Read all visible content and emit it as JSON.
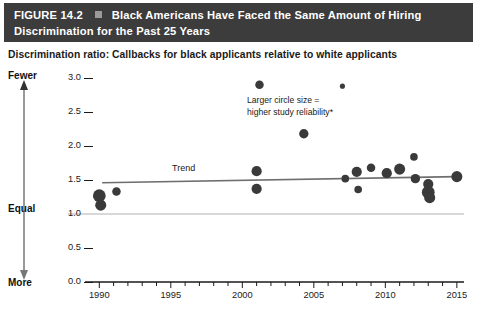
{
  "figure": {
    "label": "FIGURE 14.2",
    "separator_icon": "square-bullet",
    "title": "Black Americans Have Faced the Same Amount of Hiring Discrimination for the Past 25 Years",
    "title_line_1": "Black Americans Have Faced the Same Amount of Hiring",
    "title_line_2": "Discrimination for the Past 25 Years",
    "subtitle": "Discrimination ratio: Callbacks for black applicants relative to white applicants"
  },
  "colors": {
    "title_bar_bg": "#3c3c3c",
    "title_text": "#ffffff",
    "marker": "#3a3a3a",
    "trend_line": "#6e6e6e",
    "equal_line": "#b0b0b0",
    "axis": "#1a1a1a",
    "page_bg": "#ffffff"
  },
  "annotations": {
    "size_legend": "Larger circle size =\nhigher study reliability*",
    "size_legend_line_1": "Larger circle size =",
    "size_legend_line_2": "higher study reliability*",
    "trend_label": "Trend",
    "axis_top_label": "Fewer",
    "axis_mid_label": "Equal",
    "axis_bottom_label": "More"
  },
  "chart_data": {
    "type": "scatter",
    "title": "Black Americans Have Faced the Same Amount of Hiring Discrimination for the Past 25 Years",
    "subtitle": "Discrimination ratio: Callbacks for black applicants relative to white applicants",
    "xlabel": "",
    "ylabel": "",
    "xlim": [
      1989,
      2015.5
    ],
    "ylim": [
      0.0,
      3.1
    ],
    "xticks": [
      1990,
      1995,
      2000,
      2005,
      2010,
      2015
    ],
    "xtick_labels": [
      "1990",
      "1995",
      "2000",
      "2005",
      "2010",
      "2015"
    ],
    "minor_xtick_interval": 1,
    "yticks": [
      0.0,
      0.5,
      1.0,
      1.5,
      2.0,
      2.5,
      3.0
    ],
    "ytick_labels": [
      "0.0",
      "0.5",
      "1.0",
      "1.5",
      "2.0",
      "2.5",
      "3.0"
    ],
    "grid": false,
    "legend": "none",
    "reference_lines": [
      {
        "name": "equal-line",
        "y": 1.0,
        "label": "Equal",
        "color": "#b0b0b0"
      }
    ],
    "series": [
      {
        "name": "Audit studies (bubble size = study reliability)",
        "marker": "circle",
        "color": "#3a3a3a",
        "points": [
          {
            "x": 1990.0,
            "y": 1.27,
            "size": 15
          },
          {
            "x": 1990.1,
            "y": 1.13,
            "size": 13
          },
          {
            "x": 1991.2,
            "y": 1.33,
            "size": 10
          },
          {
            "x": 2001.0,
            "y": 1.63,
            "size": 12
          },
          {
            "x": 2001.0,
            "y": 1.37,
            "size": 12
          },
          {
            "x": 2001.2,
            "y": 2.9,
            "size": 10
          },
          {
            "x": 2004.3,
            "y": 2.18,
            "size": 11
          },
          {
            "x": 2007.0,
            "y": 2.88,
            "size": 6
          },
          {
            "x": 2007.2,
            "y": 1.52,
            "size": 9
          },
          {
            "x": 2008.0,
            "y": 1.62,
            "size": 12
          },
          {
            "x": 2008.1,
            "y": 1.36,
            "size": 9
          },
          {
            "x": 2009.0,
            "y": 1.68,
            "size": 10
          },
          {
            "x": 2010.1,
            "y": 1.6,
            "size": 12
          },
          {
            "x": 2011.0,
            "y": 1.66,
            "size": 13
          },
          {
            "x": 2012.0,
            "y": 1.84,
            "size": 9
          },
          {
            "x": 2012.1,
            "y": 1.52,
            "size": 11
          },
          {
            "x": 2013.0,
            "y": 1.44,
            "size": 12
          },
          {
            "x": 2013.0,
            "y": 1.32,
            "size": 15
          },
          {
            "x": 2013.1,
            "y": 1.24,
            "size": 13
          },
          {
            "x": 2015.0,
            "y": 1.55,
            "size": 13
          }
        ]
      }
    ],
    "trend": {
      "name": "Trend",
      "label": "Trend",
      "x_start": 1990.2,
      "y_start": 1.46,
      "x_end": 2015.0,
      "y_end": 1.55,
      "color": "#6e6e6e"
    }
  }
}
